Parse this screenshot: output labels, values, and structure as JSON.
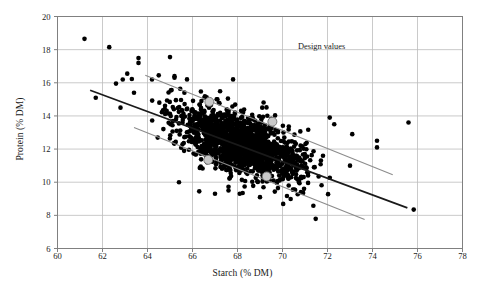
{
  "chart_data": {
    "type": "scatter",
    "title": "",
    "xlabel": "Starch (% DM)",
    "ylabel": "Protein (% DM)",
    "xlim": [
      60,
      78
    ],
    "ylim": [
      6,
      20
    ],
    "xticks": [
      60,
      62,
      64,
      66,
      68,
      70,
      72,
      74,
      76,
      78
    ],
    "yticks": [
      6,
      8,
      10,
      12,
      14,
      16,
      18,
      20
    ],
    "grid": true,
    "legend": "none",
    "annotations": [
      {
        "text": "Design values",
        "x": 72.2,
        "y": 18.15
      }
    ],
    "series": [
      {
        "name": "Samples",
        "type": "scatter",
        "marker": "filled-circle",
        "color": "#000000",
        "size": 2.3,
        "n_points": 1520,
        "correlation": -0.62,
        "x_mean": 68.15,
        "x_sd": 1.45,
        "y_mean": 12.35,
        "y_sd": 1.18,
        "description": "Dense negatively-correlated cloud of maize grain samples"
      },
      {
        "name": "Design values",
        "type": "scatter",
        "marker": "large-circle",
        "color": "#c8c8c8",
        "edge_color": "#6e6e6e",
        "size": 9,
        "points": [
          {
            "x": 66.75,
            "y": 14.85
          },
          {
            "x": 69.55,
            "y": 13.65
          },
          {
            "x": 66.7,
            "y": 11.35
          },
          {
            "x": 69.3,
            "y": 10.35
          }
        ]
      }
    ],
    "lines": [
      {
        "name": "regression-line",
        "color": "#1a1a1a",
        "width": 1.7,
        "x0": 61.45,
        "y0": 15.55,
        "x1": 75.55,
        "y1": 8.45
      },
      {
        "name": "upper-boundary-line",
        "color": "#8c8c8c",
        "width": 1.1,
        "x0": 63.9,
        "y0": 16.45,
        "x1": 74.9,
        "y1": 10.45
      },
      {
        "name": "lower-boundary-line",
        "color": "#8c8c8c",
        "width": 1.1,
        "x0": 63.4,
        "y0": 13.3,
        "x1": 73.65,
        "y1": 7.75
      }
    ]
  },
  "style": {
    "plot_bg": "#ffffff",
    "grid_color": "#bdbdbd",
    "axis_color": "#808080",
    "text_color": "#1a1a1a"
  }
}
